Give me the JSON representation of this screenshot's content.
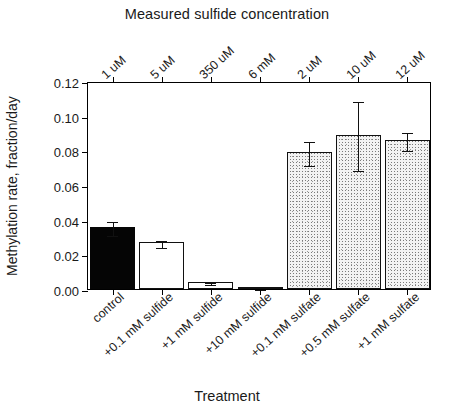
{
  "figure": {
    "top_title": "Measured sulfide concentration",
    "x_axis_title": "Treatment",
    "y_axis_title": "Methylation rate, fraction/day"
  },
  "chart_data": {
    "type": "bar",
    "title": "Measured sulfide concentration",
    "xlabel": "Treatment",
    "ylabel": "Methylation rate, fraction/day",
    "ylim": [
      0.0,
      0.12
    ],
    "ytick_labels": [
      "0.12",
      "0.10",
      "0.08",
      "0.06",
      "0.04",
      "0.02",
      "0.00"
    ],
    "ytick_values": [
      0.12,
      0.1,
      0.08,
      0.06,
      0.04,
      0.02,
      0.0
    ],
    "grid": false,
    "legend": null,
    "secondary_axis": {
      "position": "top",
      "title": "Measured sulfide concentration",
      "tick_labels": [
        "1 uM",
        "5 uM",
        "350 uM",
        "6 mM",
        "2 uM",
        "10 uM",
        "12 uM"
      ]
    },
    "categories": [
      "control",
      "+0.1 mM sulfide",
      "+1 mM sulfide",
      "+10 mM sulfide",
      "+0.1 mM sulfate",
      "+0.5 mM sulfate",
      "+1 mM sulfate"
    ],
    "values": [
      0.036,
      0.027,
      0.004,
      0.001,
      0.079,
      0.089,
      0.086
    ],
    "errors": [
      0.004,
      0.002,
      0.0008,
      0.0005,
      0.007,
      0.02,
      0.005
    ],
    "bar_fills": [
      "black",
      "white",
      "white",
      "white",
      "stipple",
      "stipple",
      "stipple"
    ],
    "colors": {
      "black_bar": "#050505",
      "white_bar": "#ffffff",
      "stipple_bar": "#f3f3f3",
      "outline": "#111111",
      "axis": "#000000",
      "background": "#ffffff"
    }
  }
}
